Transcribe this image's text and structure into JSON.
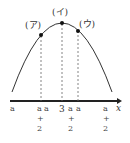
{
  "diagram": {
    "type": "parabola-axis-of-symmetry",
    "axis_label": "x",
    "axis_of_symmetry": "3",
    "points": [
      {
        "label": "(ア)",
        "x_left": "a",
        "x_right": "a+2"
      },
      {
        "label": "(イ)",
        "x_left": "a",
        "x_right": "a+2"
      },
      {
        "label": "(ウ)",
        "x_left": "a",
        "x_right": "a+2"
      }
    ],
    "tick_labels": {
      "a1": "a",
      "a2": "a",
      "a3": "a",
      "three": "3",
      "a2_top_1": "a",
      "a2_top_2": "a",
      "a2_top_3": "a",
      "plus": "+",
      "two": "2"
    },
    "colors": {
      "curve": "#333333",
      "axis": "#222222",
      "dashed": "#666666",
      "point": "#111111"
    }
  }
}
